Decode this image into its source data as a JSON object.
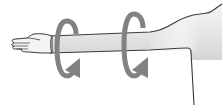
{
  "figure": {
    "title": "Arm circles",
    "parts": [
      {
        "name": "hand",
        "icon": "hand-icon"
      },
      {
        "name": "arm",
        "icon": "arm-icon"
      },
      {
        "name": "shoulder",
        "icon": "torso-outline-icon"
      },
      {
        "name": "rotation-arrow-forearm",
        "icon": "rotate-arrow-icon"
      },
      {
        "name": "rotation-arrow-upper-arm",
        "icon": "rotate-arrow-icon"
      }
    ],
    "colors": {
      "background": "#ffffff",
      "outline": "#3a3a3a",
      "arm_fill_light": "#f2f2f2",
      "arm_fill_dark": "#d9d9d9",
      "arrow": "#828282"
    }
  }
}
